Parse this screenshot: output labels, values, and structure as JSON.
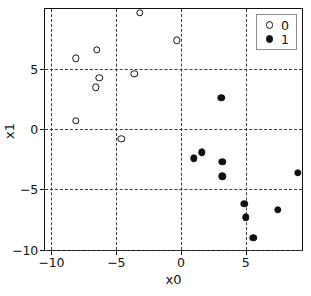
{
  "chart_data": {
    "type": "scatter",
    "title": "",
    "xlabel": "x0",
    "ylabel": "x1",
    "xlim": [
      -10.5,
      9.5
    ],
    "ylim": [
      -10.2,
      10.0
    ],
    "grid": true,
    "grid_style": "dashed",
    "legend_position": "upper right",
    "xticks": [
      -10,
      -5,
      0,
      5
    ],
    "xticklabels": [
      "−10",
      "−5",
      "0",
      "5"
    ],
    "yticks": [
      5,
      0,
      -5,
      -10
    ],
    "yticklabels": [
      "5",
      "0",
      "−5",
      "−10"
    ],
    "series": [
      {
        "name": "0",
        "marker": "open-circle",
        "color": "#111111",
        "fill": "#ffffff",
        "points": [
          [
            -3.2,
            9.7
          ],
          [
            -0.3,
            7.4
          ],
          [
            -6.5,
            6.6
          ],
          [
            -8.1,
            5.9
          ],
          [
            -6.3,
            4.3
          ],
          [
            -3.6,
            4.6
          ],
          [
            -6.6,
            3.5
          ],
          [
            -8.1,
            0.7
          ],
          [
            -4.6,
            -0.8
          ]
        ]
      },
      {
        "name": "1",
        "marker": "filled-circle",
        "color": "#111111",
        "fill": "#111111",
        "points": [
          [
            3.1,
            2.6
          ],
          [
            1.6,
            -1.9
          ],
          [
            1.0,
            -2.4
          ],
          [
            3.2,
            -2.7
          ],
          [
            3.2,
            -3.9
          ],
          [
            9.0,
            -3.6
          ],
          [
            4.9,
            -6.2
          ],
          [
            7.5,
            -6.7
          ],
          [
            5.0,
            -7.3
          ],
          [
            5.6,
            -9.0
          ]
        ]
      }
    ]
  },
  "legend": {
    "items": [
      {
        "label": "0",
        "marker": "open-circle"
      },
      {
        "label": "1",
        "marker": "filled-circle"
      }
    ]
  }
}
